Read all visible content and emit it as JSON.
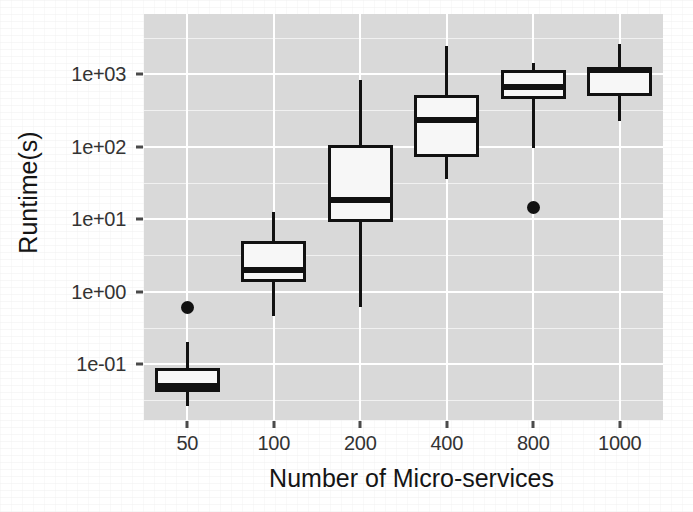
{
  "figure": {
    "panel_background": "#d9d9d9",
    "grid_color": "#ffffff",
    "ink_color": "#111111",
    "box_fill": "#f7f7f7"
  },
  "chart_data": {
    "type": "box",
    "title": "",
    "xlabel": "Number of Micro-services",
    "ylabel": "Runtime(s)",
    "x_scale": "discrete",
    "y_scale": "log10",
    "grid": true,
    "legend": null,
    "categories": [
      "50",
      "100",
      "200",
      "400",
      "800",
      "1000"
    ],
    "y_tick_labels": [
      "1e+03",
      "1e+02",
      "1e+01",
      "1e+00",
      "1e-01"
    ],
    "y_tick_values": [
      1000,
      100,
      10,
      1,
      0.1
    ],
    "ylim": [
      0.022,
      3600
    ],
    "boxes": [
      {
        "category": "50",
        "whisker_low": 0.0265,
        "q1": 0.0405,
        "median": 0.0505,
        "q3": 0.088,
        "whisker_high": 0.2,
        "outliers": [
          0.6
        ]
      },
      {
        "category": "100",
        "whisker_low": 0.46,
        "q1": 1.34,
        "median": 2.0,
        "q3": 5.0,
        "whisker_high": 12.5,
        "outliers": []
      },
      {
        "category": "200",
        "whisker_low": 0.61,
        "q1": 9.2,
        "median": 18.0,
        "q3": 105.0,
        "whisker_high": 814.0,
        "outliers": []
      },
      {
        "category": "400",
        "whisker_low": 36.0,
        "q1": 72.0,
        "median": 235.0,
        "q3": 510.0,
        "whisker_high": 2440.0,
        "outliers": []
      },
      {
        "category": "800",
        "whisker_low": 96.0,
        "q1": 447.0,
        "median": 670.0,
        "q3": 1150.0,
        "whisker_high": 1440.0,
        "outliers": [
          14.6
        ]
      },
      {
        "category": "1000",
        "whisker_low": 222.0,
        "q1": 490.0,
        "median": 1150.0,
        "q3": 1180.0,
        "whisker_high": 2630.0,
        "outliers": []
      }
    ]
  }
}
